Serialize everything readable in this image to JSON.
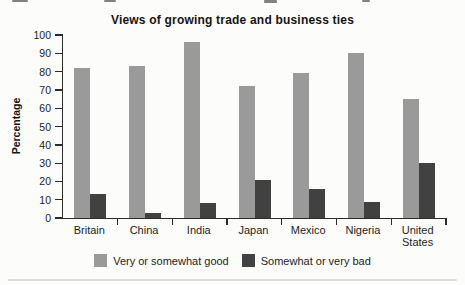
{
  "chart_data": {
    "type": "bar",
    "title": "Views of growing trade and business ties",
    "xlabel": "",
    "ylabel": "Percentage",
    "ylim": [
      0,
      100
    ],
    "ytick_step": 10,
    "grid": false,
    "legend_position": "bottom",
    "categories": [
      "Britain",
      "China",
      "India",
      "Japan",
      "Mexico",
      "Nigeria",
      "United States"
    ],
    "series": [
      {
        "name": "Very or somewhat good",
        "color": "#9a9a9a",
        "values": [
          82,
          83,
          96,
          72,
          79,
          90,
          65
        ]
      },
      {
        "name": "Somewhat or very bad",
        "color": "#414141",
        "values": [
          13,
          3,
          8,
          21,
          16,
          9,
          30
        ]
      }
    ],
    "axis_color": "#2b2b2b"
  }
}
